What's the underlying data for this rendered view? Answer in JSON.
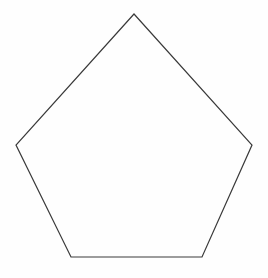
{
  "document": {
    "title": "Pentagon",
    "background_color": "#fefefe",
    "width": 268,
    "height": 278
  },
  "figure": {
    "name": "pentagon",
    "shape_type": "polygon",
    "sides": 5,
    "label": "",
    "stroke_color": "#3a3a3a",
    "stroke_width": 1.2,
    "fill_color": "none",
    "vertices": [
      {
        "name": "apex",
        "x": 134,
        "y": 14
      },
      {
        "name": "right",
        "x": 252,
        "y": 145
      },
      {
        "name": "bottom-right",
        "x": 202,
        "y": 257
      },
      {
        "name": "bottom-left",
        "x": 71,
        "y": 257
      },
      {
        "name": "left",
        "x": 16,
        "y": 145
      }
    ],
    "points_attr": "134,14 252,145 202,257 71,257 16,145"
  },
  "watermark": {
    "text": "",
    "visible": false
  }
}
